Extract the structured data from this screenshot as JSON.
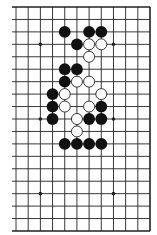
{
  "board": {
    "size": 19,
    "visible_columns_from_right": 12,
    "edges_visible": [
      "top",
      "right",
      "bottom"
    ],
    "colors": {
      "line": "#222222",
      "black_stone": "#111111",
      "white_stone": "#ffffff",
      "background": "#ffffff"
    },
    "star_points": [
      [
        10,
        4
      ],
      [
        10,
        10
      ],
      [
        10,
        16
      ],
      [
        4,
        4
      ],
      [
        4,
        10
      ],
      [
        4,
        16
      ]
    ],
    "black_stones": [
      [
        8,
        3
      ],
      [
        6,
        3
      ],
      [
        5,
        3
      ],
      [
        7,
        4
      ],
      [
        8,
        6
      ],
      [
        7,
        6
      ],
      [
        8,
        7
      ],
      [
        9,
        8
      ],
      [
        9,
        9
      ],
      [
        5,
        9
      ],
      [
        9,
        10
      ],
      [
        6,
        10
      ],
      [
        5,
        10
      ],
      [
        8,
        12
      ],
      [
        7,
        12
      ],
      [
        6,
        12
      ],
      [
        5,
        12
      ]
    ],
    "white_stones": [
      [
        6,
        4
      ],
      [
        5,
        4
      ],
      [
        6,
        5
      ],
      [
        7,
        7
      ],
      [
        6,
        7
      ],
      [
        8,
        8
      ],
      [
        5,
        8
      ],
      [
        8,
        9
      ],
      [
        6,
        9
      ],
      [
        7,
        10
      ],
      [
        7,
        11
      ]
    ]
  }
}
